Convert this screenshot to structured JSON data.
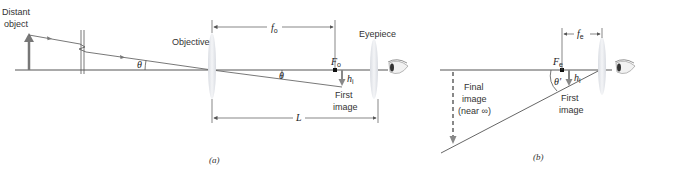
{
  "panel_a": {
    "caption": "(a)",
    "labels": {
      "distant_object_line1": "Distant",
      "distant_object_line2": "object",
      "objective": "Objective",
      "eyepiece": "Eyepiece",
      "first_image_line1": "First",
      "first_image_line2": "image",
      "theta1": "θ",
      "theta2": "θ",
      "focal_point": "F",
      "focal_point_sub": "o",
      "focal_length": "f",
      "focal_length_sub": "o",
      "image_height": "h",
      "image_height_sub": "i",
      "length": "L"
    }
  },
  "panel_b": {
    "caption": "(b)",
    "labels": {
      "final_image_line1": "Final",
      "final_image_line2": "image",
      "final_image_line3": "(near ∞)",
      "first_image_line1": "First",
      "first_image_line2": "image",
      "theta_prime": "θ′",
      "focal_point": "F",
      "focal_point_sub": "e",
      "focal_length": "f",
      "focal_length_sub": "e",
      "image_height": "h",
      "image_height_sub": "i"
    }
  },
  "colors": {
    "line": "#555555",
    "arrow": "#7a7a7a",
    "lens": "#e6e8ec"
  }
}
